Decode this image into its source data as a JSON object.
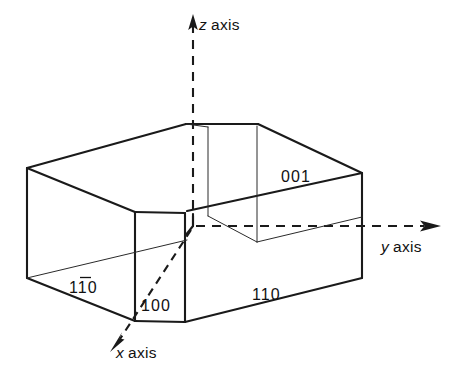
{
  "figure": {
    "background_color": "#ffffff",
    "line_color": "#1a1a1a"
  },
  "axes": [
    {
      "id": "z",
      "symbol": "z",
      "word": "axis",
      "label": "z axis",
      "arrow_direction": "up",
      "style": "dashed"
    },
    {
      "id": "y",
      "symbol": "y",
      "word": "axis",
      "label": "y axis",
      "arrow_direction": "right",
      "style": "dashed"
    },
    {
      "id": "x",
      "symbol": "x",
      "word": "axis",
      "label": "x axis",
      "arrow_direction": "down-left",
      "style": "dashed"
    }
  ],
  "face_labels": [
    {
      "id": "face-001",
      "text": "001",
      "pre": "",
      "overbar_char": "",
      "post": "001",
      "has_overbar": false
    },
    {
      "id": "face-110",
      "text": "110",
      "pre": "",
      "overbar_char": "",
      "post": "110",
      "has_overbar": false
    },
    {
      "id": "face-1-10",
      "text": "110",
      "pre": "1",
      "overbar_char": "1",
      "post": "0",
      "has_overbar": true
    },
    {
      "id": "face-100",
      "text": "100",
      "pre": "",
      "overbar_char": "",
      "post": "100",
      "has_overbar": false
    }
  ]
}
